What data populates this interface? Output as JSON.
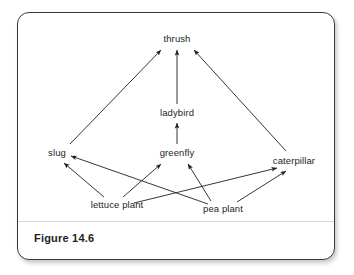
{
  "figure": {
    "caption": "Figure 14.6",
    "border_color": "#3a3a3a",
    "background_color": "#ffffff",
    "text_color": "#231f20",
    "edge_color": "#231f20"
  },
  "chart_data": {
    "type": "diagram",
    "subtype": "food-web",
    "title": "Figure 14.6",
    "nodes": [
      {
        "id": "thrush",
        "label": "thrush",
        "x": 159,
        "y": 26,
        "trophic_level": 4
      },
      {
        "id": "ladybird",
        "label": "ladybird",
        "x": 159,
        "y": 100,
        "trophic_level": 3
      },
      {
        "id": "slug",
        "label": "slug",
        "x": 39,
        "y": 140,
        "trophic_level": 2
      },
      {
        "id": "greenfly",
        "label": "greenfly",
        "x": 159,
        "y": 140,
        "trophic_level": 2
      },
      {
        "id": "caterpillar",
        "label": "caterpillar",
        "x": 276,
        "y": 148,
        "trophic_level": 2
      },
      {
        "id": "lettuce_plant",
        "label": "lettuce plant",
        "x": 99,
        "y": 192,
        "trophic_level": 1
      },
      {
        "id": "pea_plant",
        "label": "pea plant",
        "x": 205,
        "y": 196,
        "trophic_level": 1
      }
    ],
    "edges": [
      {
        "from": "slug",
        "to": "thrush",
        "x1": 52,
        "y1": 131,
        "x2": 143,
        "y2": 37
      },
      {
        "from": "ladybird",
        "to": "thrush",
        "x1": 159,
        "y1": 91,
        "x2": 159,
        "y2": 37
      },
      {
        "from": "caterpillar",
        "to": "thrush",
        "x1": 268,
        "y1": 138,
        "x2": 176,
        "y2": 37
      },
      {
        "from": "greenfly",
        "to": "ladybird",
        "x1": 159,
        "y1": 131,
        "x2": 159,
        "y2": 110
      },
      {
        "from": "lettuce_plant",
        "to": "slug",
        "x1": 86,
        "y1": 184,
        "x2": 46,
        "y2": 150
      },
      {
        "from": "lettuce_plant",
        "to": "greenfly",
        "x1": 105,
        "y1": 184,
        "x2": 143,
        "y2": 151
      },
      {
        "from": "lettuce_plant",
        "to": "caterpillar",
        "x1": 116,
        "y1": 190,
        "x2": 259,
        "y2": 155
      },
      {
        "from": "pea_plant",
        "to": "slug",
        "x1": 190,
        "y1": 191,
        "x2": 53,
        "y2": 143
      },
      {
        "from": "pea_plant",
        "to": "greenfly",
        "x1": 193,
        "y1": 188,
        "x2": 170,
        "y2": 151
      },
      {
        "from": "pea_plant",
        "to": "caterpillar",
        "x1": 219,
        "y1": 189,
        "x2": 268,
        "y2": 158
      }
    ],
    "legend": [],
    "annotations": []
  }
}
